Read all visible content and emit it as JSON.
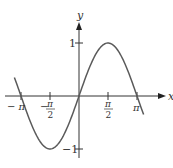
{
  "chart_data": {
    "type": "line",
    "title": "",
    "function": "y = sin(x)",
    "xlabel": "x",
    "ylabel": "y",
    "xlim": [
      -3.35,
      3.4
    ],
    "ylim": [
      -1.25,
      1.55
    ],
    "grid": false,
    "legend": null,
    "x_ticks": [
      {
        "value": -3.14159,
        "label_num": "π",
        "label_den": "",
        "sign": "−"
      },
      {
        "value": -1.5708,
        "label_num": "π",
        "label_den": "2",
        "sign": "−"
      },
      {
        "value": 1.5708,
        "label_num": "π",
        "label_den": "2",
        "sign": ""
      },
      {
        "value": 3.14159,
        "label_num": "π",
        "label_den": "",
        "sign": ""
      }
    ],
    "y_ticks": [
      {
        "value": 1,
        "label": "1"
      },
      {
        "value": -1,
        "label": "−1"
      }
    ],
    "series": [
      {
        "name": "sin(x)",
        "x": [
          -3.5,
          -3.14159,
          -2.356,
          -1.5708,
          -0.785,
          0,
          0.785,
          1.5708,
          2.356,
          3.14159,
          3.5
        ],
        "y": [
          0.351,
          0,
          -0.707,
          -1,
          -0.707,
          0,
          0.707,
          1,
          0.707,
          0,
          -0.351
        ]
      }
    ],
    "colors": {
      "curve": "#555555",
      "axes": "#333333"
    }
  },
  "labels": {
    "x_axis": "x",
    "y_axis": "y",
    "tick_neg_pi": "− π",
    "tick_neg_half_pi_sign": "−",
    "tick_pi": "π",
    "tick_half_den": "2",
    "tick_y_pos": "1",
    "tick_y_neg": "−1"
  }
}
